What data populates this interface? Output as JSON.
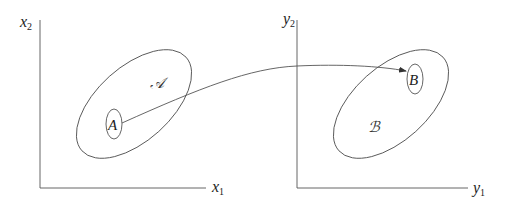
{
  "diagram": {
    "type": "mapping between spaces",
    "colors": {
      "stroke": "#555555",
      "text": "#222222",
      "background": "#ffffff"
    },
    "left_space": {
      "y_axis_label": "x",
      "y_axis_subscript": "2",
      "x_axis_label": "x",
      "x_axis_subscript": "1",
      "set_label": "𝒜",
      "point_label": "A"
    },
    "right_space": {
      "y_axis_label": "y",
      "y_axis_subscript": "2",
      "x_axis_label": "y",
      "x_axis_subscript": "1",
      "set_label": "ℬ",
      "point_label": "B"
    },
    "arrow": {
      "from": "A",
      "to": "B"
    }
  }
}
